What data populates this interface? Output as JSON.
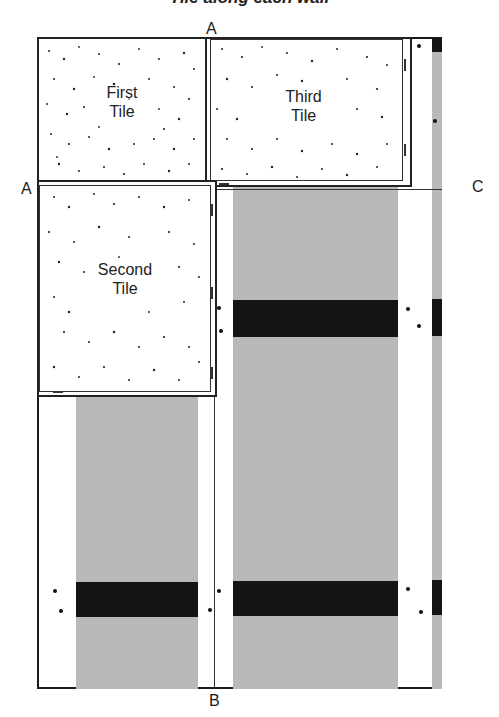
{
  "title": "Tile along each wall",
  "labels": {
    "a_top": "A",
    "a_left": "A",
    "b_bottom": "B",
    "c_right": "C"
  },
  "tiles": [
    {
      "name": "first-tile",
      "line1": "First",
      "line2": "Tile"
    },
    {
      "name": "second-tile",
      "line1": "Second",
      "line2": "Tile"
    },
    {
      "name": "third-tile",
      "line1": "Third",
      "line2": "Tile"
    }
  ],
  "colors": {
    "floor_gray": "#b9b9b9",
    "pattern_black": "#141414",
    "tile_white": "#ffffff",
    "line": "#1a1a1a"
  }
}
